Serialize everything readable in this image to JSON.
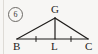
{
  "figure": {
    "problem_number": "6",
    "caption_hidden": "",
    "background_color": "#f7f6f4",
    "stroke_color": "#1e1c1a",
    "labels": {
      "apex": "G",
      "base_left": "B",
      "base_mid": "L",
      "base_right": "C"
    },
    "geometry": {
      "type": "isosceles-triangle-with-median",
      "points": {
        "G": [
          55,
          18
        ],
        "B": [
          17,
          39
        ],
        "L": [
          55,
          39
        ],
        "C": [
          88,
          39
        ]
      },
      "segments": [
        {
          "name": "BG",
          "from": "B",
          "to": "G"
        },
        {
          "name": "GC",
          "from": "G",
          "to": "C"
        },
        {
          "name": "BC",
          "from": "B",
          "to": "C"
        },
        {
          "name": "GL",
          "from": "G",
          "to": "L"
        }
      ],
      "congruence_ticks": [
        {
          "name": "tick-BL",
          "on": "BC",
          "at": [
            36,
            39
          ],
          "marks": 1
        },
        {
          "name": "tick-LC",
          "on": "BC",
          "at": [
            71,
            39
          ],
          "marks": 1
        }
      ]
    }
  }
}
